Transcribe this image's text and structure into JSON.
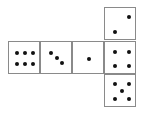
{
  "diagram": {
    "type": "cube-net",
    "faces": [
      {
        "id": "face-six",
        "value": 6,
        "col": 0,
        "row": 1
      },
      {
        "id": "face-three",
        "value": 3,
        "col": 1,
        "row": 1
      },
      {
        "id": "face-one",
        "value": 1,
        "col": 2,
        "row": 1
      },
      {
        "id": "face-four",
        "value": 4,
        "col": 3,
        "row": 1
      },
      {
        "id": "face-two",
        "value": 2,
        "col": 3,
        "row": 0
      },
      {
        "id": "face-five",
        "value": 5,
        "col": 3,
        "row": 2
      }
    ],
    "colors": {
      "border": "#8a8a8a",
      "pip": "#111111",
      "background": "#ffffff"
    }
  }
}
